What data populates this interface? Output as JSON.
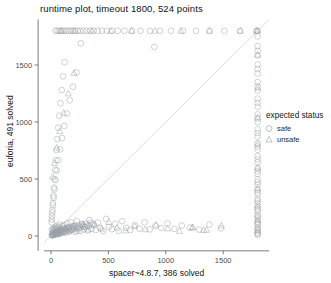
{
  "chart_data": {
    "type": "scatter",
    "title": "runtime plot, timeout 1800, 524 points",
    "xlabel": "spacer~4.8.7, 386 solved",
    "ylabel": "euforia, 491 solved",
    "xlim": [
      -60,
      1900
    ],
    "ylim": [
      -60,
      1900
    ],
    "xticks": [
      0,
      500,
      1000,
      1500
    ],
    "yticks": [
      0,
      500,
      1000,
      1500
    ],
    "xticklabels": [
      "0",
      "500",
      "1000",
      "1500"
    ],
    "yticklabels": [
      "0",
      "500",
      "1000",
      "1500"
    ],
    "timeout": 1800,
    "total_points": 524,
    "grid": false,
    "diagonal_reference_line": true,
    "legend": {
      "title": "expected status",
      "position": "right",
      "entries": [
        {
          "label": "safe",
          "marker": "circle",
          "color": "#9aa0a6"
        },
        {
          "label": "unsafe",
          "marker": "triangle",
          "color": "#9aa0a6"
        }
      ]
    },
    "marker_color": "#9aa0a6",
    "marker_opacity": 0.55,
    "series": [
      {
        "name": "safe",
        "marker": "circle",
        "points": [
          [
            12,
            8
          ],
          [
            18,
            14
          ],
          [
            22,
            9
          ],
          [
            30,
            18
          ],
          [
            35,
            12
          ],
          [
            41,
            25
          ],
          [
            16,
            30
          ],
          [
            26,
            40
          ],
          [
            44,
            33
          ],
          [
            50,
            20
          ],
          [
            58,
            28
          ],
          [
            63,
            45
          ],
          [
            70,
            16
          ],
          [
            78,
            36
          ],
          [
            8,
            55
          ],
          [
            14,
            62
          ],
          [
            20,
            48
          ],
          [
            28,
            70
          ],
          [
            34,
            58
          ],
          [
            40,
            80
          ],
          [
            48,
            66
          ],
          [
            55,
            90
          ],
          [
            62,
            74
          ],
          [
            68,
            54
          ],
          [
            75,
            100
          ],
          [
            82,
            68
          ],
          [
            90,
            50
          ],
          [
            98,
            85
          ],
          [
            105,
            40
          ],
          [
            112,
            95
          ],
          [
            120,
            60
          ],
          [
            130,
            30
          ],
          [
            140,
            110
          ],
          [
            150,
            72
          ],
          [
            160,
            45
          ],
          [
            172,
            120
          ],
          [
            185,
            55
          ],
          [
            198,
            88
          ],
          [
            210,
            35
          ],
          [
            225,
            130
          ],
          [
            240,
            66
          ],
          [
            255,
            42
          ],
          [
            270,
            105
          ],
          [
            285,
            58
          ],
          [
            300,
            78
          ],
          [
            318,
            48
          ],
          [
            335,
            140
          ],
          [
            352,
            62
          ],
          [
            370,
            95
          ],
          [
            390,
            52
          ],
          [
            410,
            118
          ],
          [
            430,
            70
          ],
          [
            455,
            44
          ],
          [
            480,
            150
          ],
          [
            505,
            80
          ],
          [
            530,
            60
          ],
          [
            560,
            108
          ],
          [
            590,
            46
          ],
          [
            620,
            130
          ],
          [
            655,
            72
          ],
          [
            690,
            52
          ],
          [
            730,
            96
          ],
          [
            770,
            64
          ],
          [
            815,
            120
          ],
          [
            860,
            58
          ],
          [
            910,
            86
          ],
          [
            960,
            70
          ],
          [
            1015,
            110
          ],
          [
            1075,
            62
          ],
          [
            1140,
            92
          ],
          [
            1210,
            74
          ],
          [
            1290,
            56
          ],
          [
            1380,
            100
          ],
          [
            1480,
            68
          ],
          [
            6,
            6
          ],
          [
            10,
            11
          ],
          [
            15,
            7
          ],
          [
            19,
            16
          ],
          [
            24,
            22
          ],
          [
            29,
            13
          ],
          [
            33,
            27
          ],
          [
            38,
            19
          ],
          [
            43,
            31
          ],
          [
            47,
            24
          ],
          [
            52,
            37
          ],
          [
            57,
            17
          ],
          [
            61,
            43
          ],
          [
            66,
            29
          ],
          [
            71,
            21
          ],
          [
            76,
            49
          ],
          [
            81,
            34
          ],
          [
            86,
            26
          ],
          [
            92,
            55
          ],
          [
            97,
            41
          ],
          [
            103,
            32
          ],
          [
            108,
            61
          ],
          [
            114,
            47
          ],
          [
            119,
            38
          ],
          [
            125,
            67
          ],
          [
            131,
            53
          ],
          [
            137,
            44
          ],
          [
            143,
            73
          ],
          [
            149,
            59
          ],
          [
            156,
            50
          ],
          [
            163,
            79
          ],
          [
            170,
            65
          ],
          [
            177,
            56
          ],
          [
            185,
            85
          ],
          [
            193,
            71
          ],
          [
            201,
            62
          ],
          [
            210,
            91
          ],
          [
            219,
            77
          ],
          [
            228,
            68
          ],
          [
            238,
            97
          ],
          [
            248,
            83
          ],
          [
            258,
            74
          ],
          [
            269,
            103
          ],
          [
            280,
            89
          ],
          [
            292,
            80
          ],
          [
            304,
            109
          ],
          [
            317,
            95
          ],
          [
            330,
            86
          ],
          [
            344,
            115
          ],
          [
            358,
            101
          ],
          [
            5,
            120
          ],
          [
            9,
            175
          ],
          [
            13,
            230
          ],
          [
            17,
            290
          ],
          [
            21,
            355
          ],
          [
            25,
            425
          ],
          [
            30,
            500
          ],
          [
            36,
            580
          ],
          [
            42,
            665
          ],
          [
            48,
            755
          ],
          [
            55,
            850
          ],
          [
            63,
            950
          ],
          [
            72,
            1055
          ],
          [
            82,
            1165
          ],
          [
            93,
            1280
          ],
          [
            105,
            1400
          ],
          [
            118,
            1525
          ],
          [
            7,
            145
          ],
          [
            11,
            205
          ],
          [
            16,
            268
          ],
          [
            23,
            336
          ],
          [
            31,
            410
          ],
          [
            40,
            490
          ],
          [
            51,
            575
          ],
          [
            64,
            665
          ],
          [
            79,
            760
          ],
          [
            96,
            860
          ],
          [
            116,
            965
          ],
          [
            138,
            1075
          ],
          [
            163,
            1190
          ],
          [
            191,
            1310
          ],
          [
            222,
            1435
          ],
          [
            40,
            1800
          ],
          [
            55,
            1800
          ],
          [
            70,
            1800
          ],
          [
            85,
            1800
          ],
          [
            100,
            1800
          ],
          [
            118,
            1800
          ],
          [
            136,
            1800
          ],
          [
            154,
            1800
          ],
          [
            172,
            1800
          ],
          [
            190,
            1800
          ],
          [
            210,
            1800
          ],
          [
            232,
            1800
          ],
          [
            256,
            1800
          ],
          [
            282,
            1800
          ],
          [
            310,
            1800
          ],
          [
            340,
            1800
          ],
          [
            372,
            1800
          ],
          [
            406,
            1800
          ],
          [
            444,
            1800
          ],
          [
            486,
            1800
          ],
          [
            532,
            1800
          ],
          [
            582,
            1800
          ],
          [
            640,
            1800
          ],
          [
            706,
            1800
          ],
          [
            780,
            1800
          ],
          [
            862,
            1800
          ],
          [
            950,
            1800
          ],
          [
            1046,
            1800
          ],
          [
            1150,
            1800
          ],
          [
            1262,
            1800
          ],
          [
            1382,
            1800
          ],
          [
            1510,
            1800
          ],
          [
            1646,
            1800
          ],
          [
            1790,
            1800
          ],
          [
            260,
            1690
          ],
          [
            900,
            1660
          ],
          [
            1800,
            10
          ],
          [
            1800,
            30
          ],
          [
            1800,
            52
          ],
          [
            1800,
            76
          ],
          [
            1800,
            100
          ],
          [
            1800,
            126
          ],
          [
            1800,
            154
          ],
          [
            1800,
            184
          ],
          [
            1800,
            216
          ],
          [
            1800,
            250
          ],
          [
            1800,
            286
          ],
          [
            1800,
            324
          ],
          [
            1800,
            364
          ],
          [
            1800,
            406
          ],
          [
            1800,
            450
          ],
          [
            1800,
            496
          ],
          [
            1800,
            544
          ],
          [
            1800,
            594
          ],
          [
            1800,
            646
          ],
          [
            1800,
            700
          ],
          [
            1800,
            756
          ],
          [
            1800,
            814
          ],
          [
            1800,
            874
          ],
          [
            1800,
            936
          ],
          [
            1800,
            1000
          ],
          [
            1800,
            1066
          ],
          [
            1800,
            1134
          ],
          [
            1800,
            1204
          ],
          [
            1800,
            1276
          ],
          [
            1800,
            1350
          ],
          [
            1800,
            1426
          ],
          [
            1800,
            1504
          ],
          [
            1800,
            1584
          ],
          [
            1800,
            1666
          ],
          [
            1800,
            1750
          ],
          [
            1800,
            1800
          ],
          [
            1800,
            22
          ],
          [
            1800,
            64
          ],
          [
            1800,
            112
          ],
          [
            1800,
            168
          ],
          [
            1800,
            232
          ],
          [
            1800,
            304
          ],
          [
            1800,
            384
          ],
          [
            1800,
            472
          ],
          [
            1800,
            568
          ],
          [
            1800,
            672
          ],
          [
            1800,
            784
          ],
          [
            1800,
            904
          ],
          [
            1800,
            1032
          ],
          [
            1800,
            1168
          ],
          [
            1800,
            1312
          ],
          [
            1800,
            1464
          ],
          [
            1800,
            1624
          ]
        ]
      },
      {
        "name": "unsafe",
        "marker": "triangle",
        "points": [
          [
            20,
            35
          ],
          [
            45,
            18
          ],
          [
            70,
            52
          ],
          [
            95,
            28
          ],
          [
            125,
            66
          ],
          [
            155,
            38
          ],
          [
            190,
            80
          ],
          [
            230,
            46
          ],
          [
            275,
            94
          ],
          [
            325,
            56
          ],
          [
            380,
            108
          ],
          [
            440,
            64
          ],
          [
            505,
            122
          ],
          [
            575,
            72
          ],
          [
            650,
            48
          ],
          [
            730,
            86
          ],
          [
            820,
            58
          ],
          [
            915,
            100
          ],
          [
            1015,
            66
          ],
          [
            1120,
            44
          ],
          [
            1235,
            78
          ],
          [
            1355,
            54
          ],
          [
            1485,
            92
          ],
          [
            15,
            520
          ],
          [
            30,
            640
          ],
          [
            50,
            775
          ],
          [
            76,
            920
          ],
          [
            110,
            1080
          ],
          [
            150,
            1250
          ],
          [
            200,
            1430
          ],
          [
            88,
            1800
          ],
          [
            205,
            1800
          ],
          [
            355,
            1800
          ],
          [
            520,
            1800
          ],
          [
            700,
            1800
          ],
          [
            905,
            1800
          ],
          [
            1130,
            1800
          ],
          [
            1380,
            1800
          ],
          [
            1650,
            1800
          ],
          [
            1800,
            46
          ],
          [
            1800,
            140
          ],
          [
            1800,
            268
          ],
          [
            1800,
            420
          ],
          [
            1800,
            600
          ],
          [
            1800,
            808
          ],
          [
            1800,
            1040
          ],
          [
            1800,
            1300
          ],
          [
            1800,
            1590
          ],
          [
            1800,
            1800
          ],
          [
            1790,
            1800
          ],
          [
            1230,
            72
          ],
          [
            1330,
            52
          ]
        ]
      }
    ]
  }
}
